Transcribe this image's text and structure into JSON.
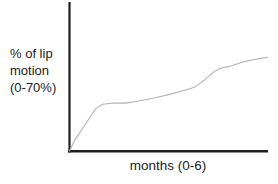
{
  "chart_data": {
    "type": "line",
    "title": "",
    "xlabel": "months (0-6)",
    "ylabel": "% of lip motion (0-70%)",
    "ylabel_lines": [
      "% of lip",
      "motion",
      "(0-70%)"
    ],
    "x_axis_range_months": [
      0,
      6
    ],
    "y_axis_range_percent": [
      0,
      70
    ],
    "grid": false,
    "legend": "none",
    "line_color": "#b3b3b3",
    "axis_color": "#1f1f1f",
    "series": [
      {
        "name": "lip motion recovery",
        "x": [
          0,
          0.15,
          0.5,
          0.8,
          1.0,
          1.3,
          1.7,
          2.1,
          2.6,
          3.0,
          3.5,
          3.8,
          4.1,
          4.4,
          4.6,
          4.8,
          5.0,
          5.3,
          5.6,
          5.8,
          6.0
        ],
        "y": [
          0,
          5,
          13,
          20,
          22,
          22.5,
          22.5,
          23.5,
          25,
          26.5,
          28.5,
          30,
          33.5,
          37.5,
          39,
          39.5,
          40.5,
          42,
          43,
          43.5,
          44
        ]
      }
    ]
  }
}
